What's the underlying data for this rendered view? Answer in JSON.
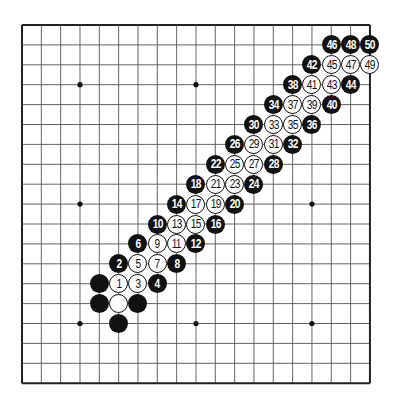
{
  "board": {
    "size": 19,
    "origin": {
      "x": 22,
      "y": 25
    },
    "step": {
      "x": 19.33,
      "y": 19.9
    },
    "line_color": "#555555",
    "border_color": "#222222",
    "star_points": [
      [
        3,
        3
      ],
      [
        9,
        3
      ],
      [
        15,
        3
      ],
      [
        3,
        9
      ],
      [
        9,
        9
      ],
      [
        15,
        9
      ],
      [
        3,
        15
      ],
      [
        9,
        15
      ],
      [
        15,
        15
      ]
    ]
  },
  "colors": {
    "black": "#111111",
    "white": "#ffffff"
  },
  "stones": [
    {
      "c": 4,
      "r": 13,
      "color": "black",
      "label": ""
    },
    {
      "c": 4,
      "r": 14,
      "color": "black",
      "label": ""
    },
    {
      "c": 5,
      "r": 14,
      "color": "white",
      "label": ""
    },
    {
      "c": 6,
      "r": 14,
      "color": "black",
      "label": ""
    },
    {
      "c": 5,
      "r": 15,
      "color": "black",
      "label": ""
    },
    {
      "c": 5,
      "r": 13,
      "color": "white",
      "label": "1"
    },
    {
      "c": 5,
      "r": 12,
      "color": "black",
      "label": "2"
    },
    {
      "c": 6,
      "r": 13,
      "color": "white",
      "label": "3"
    },
    {
      "c": 7,
      "r": 13,
      "color": "black",
      "label": "4"
    },
    {
      "c": 6,
      "r": 12,
      "color": "white",
      "label": "5"
    },
    {
      "c": 6,
      "r": 11,
      "color": "black",
      "label": "6"
    },
    {
      "c": 7,
      "r": 12,
      "color": "white",
      "label": "7"
    },
    {
      "c": 8,
      "r": 12,
      "color": "black",
      "label": "8"
    },
    {
      "c": 7,
      "r": 11,
      "color": "white",
      "label": "9"
    },
    {
      "c": 7,
      "r": 10,
      "color": "black",
      "label": "10"
    },
    {
      "c": 8,
      "r": 11,
      "color": "white",
      "label": "11"
    },
    {
      "c": 9,
      "r": 11,
      "color": "black",
      "label": "12"
    },
    {
      "c": 8,
      "r": 10,
      "color": "white",
      "label": "13"
    },
    {
      "c": 8,
      "r": 9,
      "color": "black",
      "label": "14"
    },
    {
      "c": 9,
      "r": 10,
      "color": "white",
      "label": "15"
    },
    {
      "c": 10,
      "r": 10,
      "color": "black",
      "label": "16"
    },
    {
      "c": 9,
      "r": 9,
      "color": "white",
      "label": "17"
    },
    {
      "c": 9,
      "r": 8,
      "color": "black",
      "label": "18"
    },
    {
      "c": 10,
      "r": 9,
      "color": "white",
      "label": "19"
    },
    {
      "c": 11,
      "r": 9,
      "color": "black",
      "label": "20"
    },
    {
      "c": 10,
      "r": 8,
      "color": "white",
      "label": "21"
    },
    {
      "c": 10,
      "r": 7,
      "color": "black",
      "label": "22"
    },
    {
      "c": 11,
      "r": 8,
      "color": "white",
      "label": "23"
    },
    {
      "c": 12,
      "r": 8,
      "color": "black",
      "label": "24"
    },
    {
      "c": 11,
      "r": 7,
      "color": "white",
      "label": "25"
    },
    {
      "c": 11,
      "r": 6,
      "color": "black",
      "label": "26"
    },
    {
      "c": 12,
      "r": 7,
      "color": "white",
      "label": "27"
    },
    {
      "c": 13,
      "r": 7,
      "color": "black",
      "label": "28"
    },
    {
      "c": 12,
      "r": 6,
      "color": "white",
      "label": "29"
    },
    {
      "c": 12,
      "r": 5,
      "color": "black",
      "label": "30"
    },
    {
      "c": 13,
      "r": 6,
      "color": "white",
      "label": "31"
    },
    {
      "c": 14,
      "r": 6,
      "color": "black",
      "label": "32"
    },
    {
      "c": 13,
      "r": 5,
      "color": "white",
      "label": "33"
    },
    {
      "c": 13,
      "r": 4,
      "color": "black",
      "label": "34"
    },
    {
      "c": 14,
      "r": 5,
      "color": "white",
      "label": "35"
    },
    {
      "c": 15,
      "r": 5,
      "color": "black",
      "label": "36"
    },
    {
      "c": 14,
      "r": 4,
      "color": "white",
      "label": "37"
    },
    {
      "c": 14,
      "r": 3,
      "color": "black",
      "label": "38"
    },
    {
      "c": 15,
      "r": 4,
      "color": "white",
      "label": "39"
    },
    {
      "c": 16,
      "r": 4,
      "color": "black",
      "label": "40"
    },
    {
      "c": 15,
      "r": 3,
      "color": "white",
      "label": "41"
    },
    {
      "c": 15,
      "r": 2,
      "color": "black",
      "label": "42"
    },
    {
      "c": 16,
      "r": 3,
      "color": "white",
      "label": "43"
    },
    {
      "c": 17,
      "r": 3,
      "color": "black",
      "label": "44"
    },
    {
      "c": 16,
      "r": 2,
      "color": "white",
      "label": "45"
    },
    {
      "c": 16,
      "r": 1,
      "color": "black",
      "label": "46"
    },
    {
      "c": 17,
      "r": 2,
      "color": "white",
      "label": "47"
    },
    {
      "c": 17,
      "r": 1,
      "color": "black",
      "label": "48"
    },
    {
      "c": 18,
      "r": 2,
      "color": "white",
      "label": "49"
    },
    {
      "c": 18,
      "r": 1,
      "color": "black",
      "label": "50"
    }
  ]
}
